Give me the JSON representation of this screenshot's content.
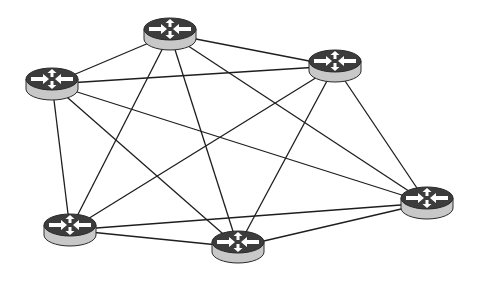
{
  "diagram": {
    "type": "full-mesh-network",
    "node_icon": "router-icon",
    "colors": {
      "background": "#ffffff",
      "link": "#1e1e1e",
      "router_top": "#3c3c3c",
      "router_side": "#c8c8c8",
      "router_arrows": "#ffffff"
    },
    "nodes": [
      {
        "id": "R1",
        "x": 170,
        "y": 29
      },
      {
        "id": "R2",
        "x": 335,
        "y": 61
      },
      {
        "id": "R3",
        "x": 52,
        "y": 79
      },
      {
        "id": "R4",
        "x": 427,
        "y": 198
      },
      {
        "id": "R5",
        "x": 70,
        "y": 225
      },
      {
        "id": "R6",
        "x": 238,
        "y": 242
      }
    ],
    "links": [
      [
        "R1",
        "R2"
      ],
      [
        "R1",
        "R3"
      ],
      [
        "R1",
        "R4"
      ],
      [
        "R1",
        "R5"
      ],
      [
        "R1",
        "R6"
      ],
      [
        "R2",
        "R3"
      ],
      [
        "R2",
        "R4"
      ],
      [
        "R2",
        "R5"
      ],
      [
        "R2",
        "R6"
      ],
      [
        "R3",
        "R4"
      ],
      [
        "R3",
        "R5"
      ],
      [
        "R3",
        "R6"
      ],
      [
        "R4",
        "R5"
      ],
      [
        "R4",
        "R6"
      ],
      [
        "R5",
        "R6"
      ]
    ]
  }
}
